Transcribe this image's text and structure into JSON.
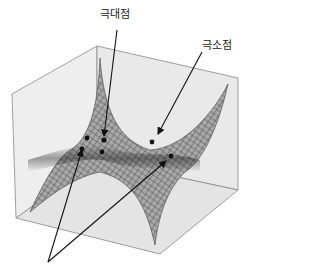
{
  "labels": {
    "local_max": "극대점",
    "local_min": "극소점"
  },
  "diagram": {
    "type": "3d-surface",
    "annotations": [
      {
        "text": "극대점",
        "target": "local maximum point"
      },
      {
        "text": "극소점",
        "target": "local minimum point"
      },
      {
        "text": "",
        "target": "two saddle points (unlabeled arrows from bottom)"
      }
    ]
  },
  "colors": {
    "box_face": "#ececec",
    "box_edge": "#777777",
    "mesh": "#4a4a4a",
    "surface": "#9a9a9a",
    "arrow": "#111111"
  }
}
